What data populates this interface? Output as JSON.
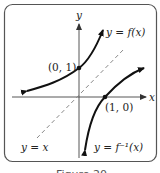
{
  "figure": {
    "caption": "Figure 20",
    "axes": {
      "x_label": "x",
      "y_label": "y"
    },
    "curves": {
      "f_label": "y = f(x)",
      "f_inverse_label": "y = f⁻¹(x)",
      "identity_label": "y = x"
    },
    "points": {
      "f_point_label": "(0, 1)",
      "f_inverse_point_label": "(1, 0)"
    },
    "colors": {
      "curve": "#111111",
      "axis": "#444444",
      "dashed": "#888888",
      "frame": "#555555"
    }
  }
}
